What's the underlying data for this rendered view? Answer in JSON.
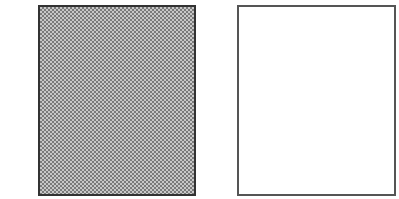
{
  "diagram": {
    "panels": [
      {
        "id": "left",
        "fill": "dithered-gray-pattern",
        "border_color": "#333333",
        "fill_colors": [
          "#7a7a7a",
          "#c8c8c8"
        ]
      },
      {
        "id": "right",
        "fill": "white",
        "border_color": "#555555",
        "fill_colors": [
          "#ffffff"
        ]
      }
    ]
  }
}
